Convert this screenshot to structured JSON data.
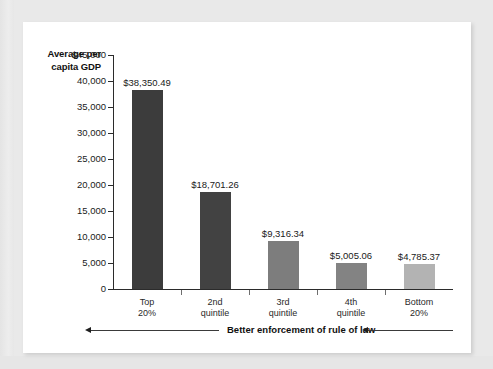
{
  "chart_data": {
    "type": "bar",
    "title": "",
    "subtitle": "",
    "xlabel": "Better enforcement of rule of law",
    "ylabel": "Average per capita GDP",
    "categories": [
      "Top\n20%",
      "2nd\nquintile",
      "3rd\nquintile",
      "4th\nquintile",
      "Bottom\n20%"
    ],
    "category_lines": [
      [
        "Top",
        "20%"
      ],
      [
        "2nd",
        "quintile"
      ],
      [
        "3rd",
        "quintile"
      ],
      [
        "4th",
        "quintile"
      ],
      [
        "Bottom",
        "20%"
      ]
    ],
    "values": [
      38350.49,
      18701.26,
      9316.34,
      5005.06,
      4785.37
    ],
    "value_labels": [
      "$38,350.49",
      "$18,701.26",
      "$9,316.34",
      "$5,005.06",
      "$4,785.37"
    ],
    "bar_colors": [
      "#3c3c3c",
      "#424242",
      "#7d7d7d",
      "#838383",
      "#b3b3b3"
    ],
    "ylim": [
      0,
      45000
    ],
    "ytick_values": [
      45000,
      40000,
      35000,
      30000,
      25000,
      20000,
      15000,
      10000,
      5000,
      0
    ],
    "ytick_labels": [
      "$45,000",
      "40,000",
      "35,000",
      "30,000",
      "25,000",
      "20,000",
      "15,000",
      "10,000",
      "5,000",
      "0"
    ],
    "grid": false,
    "legend": false,
    "legend_position": "none"
  },
  "annotation": {
    "text": "Better enforcement of rule of law",
    "arrow_direction": "left",
    "arrow_count": 2
  },
  "colors": {
    "page_background": "#e9e9e9",
    "panel_background": "#ffffff",
    "axis": "#2b2b2b",
    "text": "#1a1a1a"
  }
}
